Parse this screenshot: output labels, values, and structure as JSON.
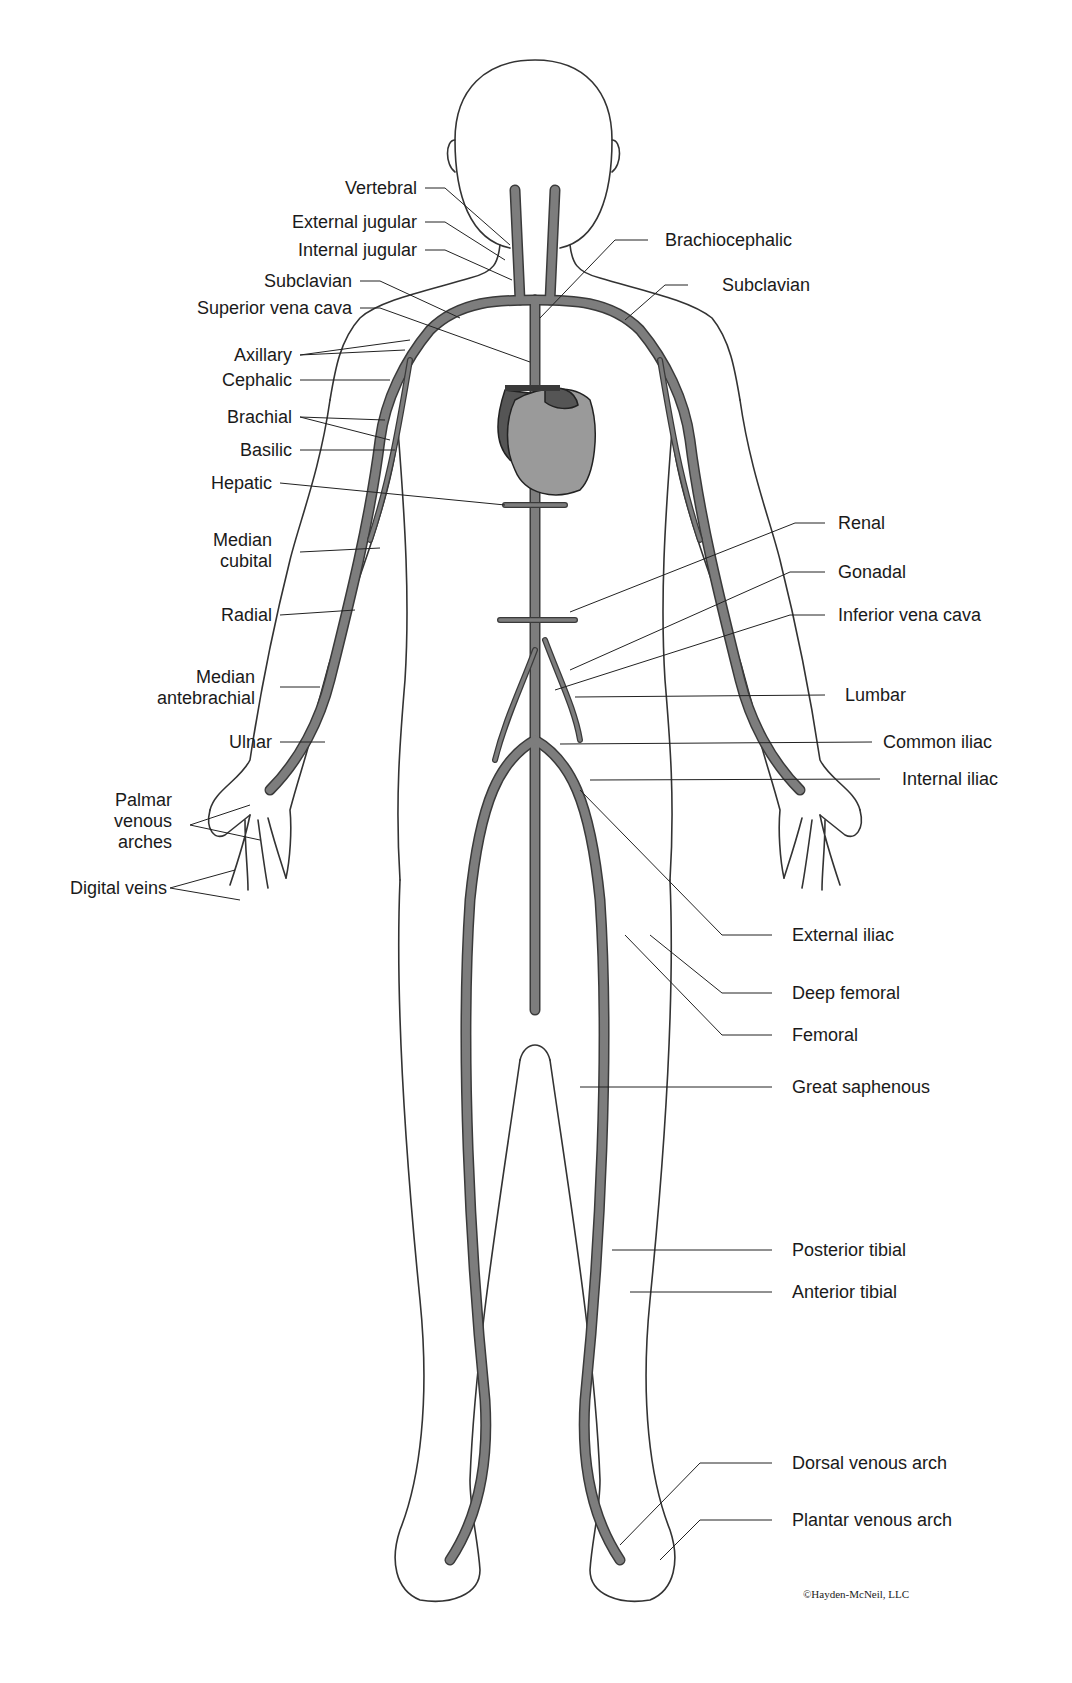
{
  "colors": {
    "vein": "#7d7d7d",
    "vein_outline": "#3a3a3a",
    "outline": "#333333",
    "heart_light": "#9a9a9a",
    "heart_dark": "#555555",
    "text": "#1a1a1a"
  },
  "labels_left": [
    {
      "id": "vertebral",
      "text": "Vertebral"
    },
    {
      "id": "external-jugular",
      "text": "External jugular"
    },
    {
      "id": "internal-jugular",
      "text": "Internal jugular"
    },
    {
      "id": "subclavian-left",
      "text": "Subclavian"
    },
    {
      "id": "superior-vena-cava",
      "text": "Superior vena cava"
    },
    {
      "id": "axillary",
      "text": "Axillary"
    },
    {
      "id": "cephalic",
      "text": "Cephalic"
    },
    {
      "id": "brachial",
      "text": "Brachial"
    },
    {
      "id": "basilic",
      "text": "Basilic"
    },
    {
      "id": "hepatic",
      "text": "Hepatic"
    },
    {
      "id": "median-cubital",
      "text": "Median\ncubital"
    },
    {
      "id": "radial",
      "text": "Radial"
    },
    {
      "id": "median-antebrachial",
      "text": "Median\nantebrachial"
    },
    {
      "id": "ulnar",
      "text": "Ulnar"
    },
    {
      "id": "palmar-venous-arches",
      "text": "Palmar\nvenous\narches"
    },
    {
      "id": "digital-veins",
      "text": "Digital veins"
    }
  ],
  "labels_right": [
    {
      "id": "brachiocephalic",
      "text": "Brachiocephalic"
    },
    {
      "id": "subclavian-right",
      "text": "Subclavian"
    },
    {
      "id": "renal",
      "text": "Renal"
    },
    {
      "id": "gonadal",
      "text": "Gonadal"
    },
    {
      "id": "inferior-vena-cava",
      "text": "Inferior vena cava"
    },
    {
      "id": "lumbar",
      "text": "Lumbar"
    },
    {
      "id": "common-iliac",
      "text": "Common iliac"
    },
    {
      "id": "internal-iliac",
      "text": "Internal iliac"
    },
    {
      "id": "external-iliac",
      "text": "External iliac"
    },
    {
      "id": "deep-femoral",
      "text": "Deep femoral"
    },
    {
      "id": "femoral",
      "text": "Femoral"
    },
    {
      "id": "great-saphenous",
      "text": "Great saphenous"
    },
    {
      "id": "posterior-tibial",
      "text": "Posterior tibial"
    },
    {
      "id": "anterior-tibial",
      "text": "Anterior tibial"
    },
    {
      "id": "dorsal-venous-arch",
      "text": "Dorsal venous arch"
    },
    {
      "id": "plantar-venous-arch",
      "text": "Plantar venous arch"
    }
  ],
  "copyright": "©Hayden-McNeil, LLC"
}
